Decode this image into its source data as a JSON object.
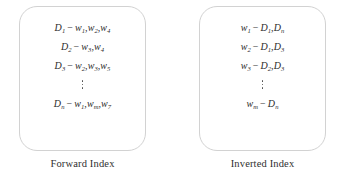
{
  "diagram": {
    "panels": [
      {
        "id": "forward-index",
        "caption": "Forward Index",
        "entries": [
          {
            "key": "D",
            "key_sub": "1",
            "op": "−",
            "values": [
              {
                "sym": "w",
                "sub": "1"
              },
              {
                "sym": "w",
                "sub": "2"
              },
              {
                "sym": "w",
                "sub": "4"
              }
            ]
          },
          {
            "key": "D",
            "key_sub": "2",
            "op": "−",
            "values": [
              {
                "sym": "w",
                "sub": "3"
              },
              {
                "sym": "w",
                "sub": "4"
              }
            ]
          },
          {
            "key": "D",
            "key_sub": "3",
            "op": "−",
            "values": [
              {
                "sym": "w",
                "sub": "2"
              },
              {
                "sym": "w",
                "sub": "3"
              },
              {
                "sym": "w",
                "sub": "5"
              }
            ]
          },
          {
            "ellipsis": true
          },
          {
            "key": "D",
            "key_sub": "n",
            "op": "−",
            "values": [
              {
                "sym": "w",
                "sub": "1"
              },
              {
                "sym": "w",
                "sub": "m"
              },
              {
                "sym": "w",
                "sub": "7"
              }
            ]
          }
        ]
      },
      {
        "id": "inverted-index",
        "caption": "Inverted Index",
        "entries": [
          {
            "key": "w",
            "key_sub": "1",
            "op": "−",
            "values": [
              {
                "sym": "D",
                "sub": "1"
              },
              {
                "sym": "D",
                "sub": "n"
              }
            ]
          },
          {
            "key": "w",
            "key_sub": "2",
            "op": "−",
            "values": [
              {
                "sym": "D",
                "sub": "1"
              },
              {
                "sym": "D",
                "sub": "3"
              }
            ]
          },
          {
            "key": "w",
            "key_sub": "3",
            "op": "−",
            "values": [
              {
                "sym": "D",
                "sub": "2"
              },
              {
                "sym": "D",
                "sub": "3"
              }
            ]
          },
          {
            "ellipsis": true
          },
          {
            "key": "w",
            "key_sub": "m",
            "op": "−",
            "values": [
              {
                "sym": "D",
                "sub": "n"
              }
            ]
          }
        ]
      }
    ],
    "colors": {
      "box_border": "#d2d2d2",
      "text": "#2c2c2c",
      "caption": "#2f2f2f",
      "background": "#ffffff"
    }
  }
}
